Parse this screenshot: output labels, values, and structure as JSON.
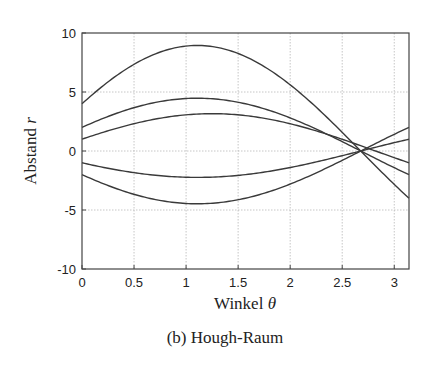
{
  "chart_data": {
    "type": "line",
    "title": "",
    "caption": "(b) Hough-Raum",
    "xlabel": "Winkel θ",
    "ylabel": "Abstand r",
    "xlim": [
      0,
      3.14159
    ],
    "ylim": [
      -10,
      10
    ],
    "grid": true,
    "legend": null,
    "xticks": [
      0,
      0.5,
      1,
      1.5,
      2,
      2.5,
      3
    ],
    "xtick_labels": [
      "0",
      "0.5",
      "1",
      "1.5",
      "2",
      "2.5",
      "3"
    ],
    "yticks": [
      -10,
      -5,
      0,
      5,
      10
    ],
    "ytick_labels": [
      "-10",
      "-5",
      "0",
      "5",
      "10"
    ],
    "formula": "r = x·cos(θ) + y·sin(θ)",
    "series": [
      {
        "name": "point (4, 8)",
        "x": 4,
        "y": 8,
        "r_at_0": 4,
        "r_max": 8.94,
        "r_at_pi": -4
      },
      {
        "name": "point (2, 4)",
        "x": 2,
        "y": 4,
        "r_at_0": 2,
        "r_max": 4.47,
        "r_at_pi": -2
      },
      {
        "name": "point (1, 3)",
        "x": 1,
        "y": 3,
        "r_at_0": 1,
        "r_max": 3.16,
        "r_at_pi": -1
      },
      {
        "name": "point (-1, -2)",
        "x": -1,
        "y": -2,
        "r_at_0": -1,
        "r_min": -2.24,
        "r_at_pi": 1
      },
      {
        "name": "point (-2, -4)",
        "x": -2,
        "y": -4,
        "r_at_0": -2,
        "r_min": -4.47,
        "r_at_pi": 2
      }
    ],
    "intersection": {
      "theta": 2.68,
      "r": 0
    }
  },
  "labels": {
    "xlabel_text": "Winkel ",
    "xlabel_symbol": "θ",
    "ylabel_text": "Abstand ",
    "ylabel_symbol": "r",
    "caption": "(b) Hough-Raum"
  }
}
